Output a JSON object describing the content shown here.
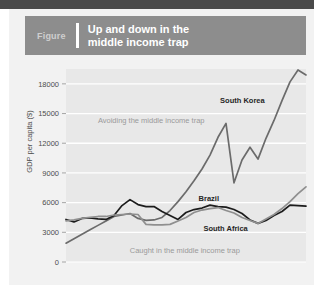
{
  "figure": {
    "label": "Figure",
    "title": "Up and down in the\nmiddle income trap"
  },
  "colors": {
    "header_bar": "#8d8d8d",
    "page_background": "#f2f2f2",
    "plot_background": "#e8e8e8",
    "gridline": "#ffffff",
    "south_korea": "#6b6b6b",
    "brazil": "#1c1c1c",
    "south_africa": "#8f8f8f",
    "annotation_note": "#9a9a9a",
    "annotation_series": "#262626"
  },
  "chart_data": {
    "type": "line",
    "title": "Up and down in the middle income trap",
    "xlabel": "",
    "ylabel": "GDP per capita ($)",
    "ylim": [
      0,
      19500
    ],
    "yticks": [
      0,
      3000,
      6000,
      9000,
      12000,
      15000,
      18000
    ],
    "ytick_labels": [
      "0",
      "3000",
      "6000",
      "9000",
      "12000",
      "15000",
      "18000"
    ],
    "xlim": [
      0,
      30
    ],
    "xticks": [],
    "xtick_labels": [],
    "grid": "horizontal",
    "legend": "inline-annotations",
    "x": [
      0,
      1,
      2,
      3,
      4,
      5,
      6,
      7,
      8,
      9,
      10,
      11,
      12,
      13,
      14,
      15,
      16,
      17,
      18,
      19,
      20,
      21,
      22,
      23,
      24,
      25,
      26,
      27,
      28,
      29,
      30
    ],
    "series": [
      {
        "name": "South Korea",
        "color": "#6b6b6b",
        "values": [
          1900,
          2350,
          2800,
          3250,
          3700,
          4150,
          4600,
          4750,
          4900,
          4400,
          4200,
          4250,
          4500,
          5200,
          6100,
          7100,
          8200,
          9400,
          10800,
          12600,
          14000,
          8000,
          10300,
          11600,
          10400,
          12500,
          14300,
          16300,
          18200,
          19400,
          18900
        ]
      },
      {
        "name": "Brazil",
        "color": "#1c1c1c",
        "values": [
          4300,
          4050,
          4400,
          4450,
          4350,
          4300,
          4700,
          5700,
          6300,
          5800,
          5600,
          5600,
          5100,
          4700,
          4300,
          5000,
          5300,
          5450,
          5750,
          5600,
          5550,
          5300,
          4900,
          4250,
          3900,
          4200,
          4700,
          5100,
          5750,
          5700,
          5650
        ]
      },
      {
        "name": "South Africa",
        "color": "#8f8f8f",
        "values": [
          4150,
          4250,
          4400,
          4500,
          4600,
          4600,
          4750,
          4800,
          4850,
          4800,
          3800,
          3750,
          3750,
          3800,
          4150,
          4500,
          5000,
          5250,
          5400,
          5500,
          5200,
          4950,
          4500,
          4200,
          3900,
          4350,
          4800,
          5400,
          6100,
          6900,
          7600
        ]
      }
    ],
    "annotations": [
      {
        "text": "South Korea",
        "kind": "series-label",
        "x_pct": 0.735,
        "y_value": 16100
      },
      {
        "text": "Brazil",
        "kind": "series-label",
        "x_pct": 0.595,
        "y_value": 6150
      },
      {
        "text": "South Africa",
        "kind": "series-label",
        "x_pct": 0.665,
        "y_value": 3150
      },
      {
        "text": "Avoiding the middle income trap",
        "kind": "note",
        "x_pct": 0.355,
        "y_value": 14000
      },
      {
        "text": "Caught in the middle income trap",
        "kind": "note",
        "x_pct": 0.495,
        "y_value": 950
      }
    ]
  }
}
